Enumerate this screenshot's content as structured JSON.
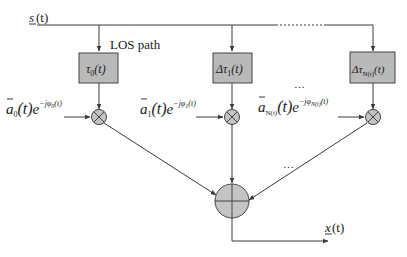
{
  "diagram": {
    "type": "signal-flow block diagram (multipath channel model)",
    "colors": {
      "line": "#3a3a3a",
      "block_fill": "#b9b9b9",
      "block_stroke": "#444444",
      "node_fill": "#c4c4c4",
      "background": "#ffffff"
    },
    "input": {
      "label_var": "s",
      "label_arg": "(t)"
    },
    "output": {
      "label_var": "x",
      "label_arg": "(t)"
    },
    "los_label": "LOS path",
    "branches": [
      {
        "id": "branch-0",
        "delay_symbol": "τ",
        "delay_prefix": "",
        "delay_sub": "0",
        "delay_arg": "(t)",
        "gain_var": "a",
        "gain_sub": "0",
        "gain_arg": "(t)",
        "exp_base": "e",
        "exp_power": "−jφ",
        "exp_sub": "0",
        "exp_arg": "(t)"
      },
      {
        "id": "branch-1",
        "delay_symbol": "τ",
        "delay_prefix": "Δ",
        "delay_sub": "1",
        "delay_arg": "(t)",
        "gain_var": "a",
        "gain_sub": "1",
        "gain_arg": "(t)",
        "exp_base": "e",
        "exp_power": "−jφ",
        "exp_sub": "1",
        "exp_arg": "(t)"
      },
      {
        "id": "branch-N",
        "delay_symbol": "τ",
        "delay_prefix": "Δ",
        "delay_sub": "N(t)",
        "delay_arg": "(t)",
        "gain_var": "a",
        "gain_sub": "N(t)",
        "gain_arg": "(t)",
        "exp_base": "e",
        "exp_power": "−jφ",
        "exp_sub": "N(t)",
        "exp_arg": "(t)"
      }
    ],
    "ellipsis": "…",
    "multiplier_symbol": "⊗",
    "summer_symbol": "⊕"
  }
}
